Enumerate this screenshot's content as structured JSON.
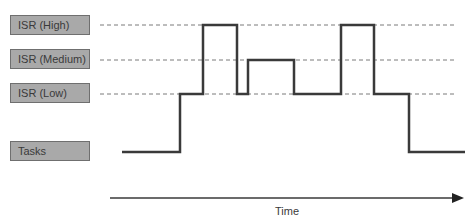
{
  "levels": [
    {
      "id": "high",
      "label": "ISR (High)"
    },
    {
      "id": "medium",
      "label": "ISR (Medium)"
    },
    {
      "id": "low",
      "label": "ISR (Low)"
    },
    {
      "id": "tasks",
      "label": "Tasks"
    }
  ],
  "axis": {
    "label": "Time"
  },
  "signal": {
    "description": "Execution level over time",
    "sequence": [
      "tasks",
      "low",
      "high",
      "low",
      "medium",
      "low",
      "high",
      "low",
      "tasks"
    ]
  },
  "colors": {
    "line": "#3a3a3a",
    "dash": "#7a7a7a",
    "box_fill": "#a9a9a9"
  }
}
